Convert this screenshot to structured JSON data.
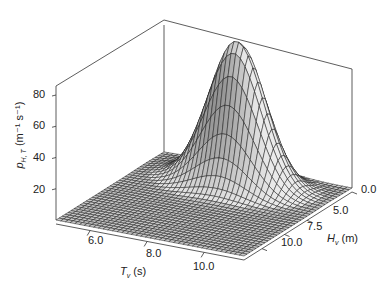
{
  "chart_data": {
    "type": "surface3d",
    "title": "",
    "xlabel": "T_v (s)",
    "ylabel": "H_v (m)",
    "zlabel": "p_{H,T} (m^-1 s^-1)",
    "x_ticks": [
      "6.0",
      "8.0",
      "10.0"
    ],
    "y_ticks": [
      "0.0",
      "5.0",
      "7.5",
      "10.0"
    ],
    "z_ticks": [
      "20",
      "40",
      "60",
      "80"
    ],
    "xlim": [
      4.8,
      11.4
    ],
    "ylim": [
      0,
      12
    ],
    "zlim": [
      0,
      80
    ],
    "peak": {
      "x": 8.2,
      "y": 2.6,
      "z": 92
    }
  },
  "axes": {
    "z_label_main": "p",
    "z_label_sub": "H, T",
    "z_label_units": "(m⁻¹ s⁻¹)",
    "x_label_main": "T",
    "x_label_sub": "v",
    "x_label_units": "(s)",
    "y_label_main": "H",
    "y_label_sub": "v",
    "y_label_units": "(m)"
  }
}
